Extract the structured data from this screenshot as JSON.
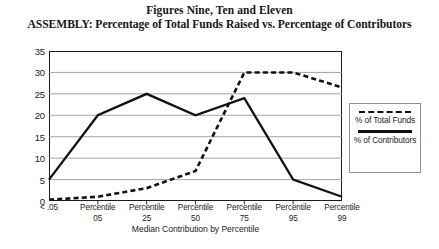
{
  "titles": {
    "main": "Figures Nine, Ten and Eleven",
    "sub": "ASSEMBLY: Percentage of Total Funds Raised vs. Percentage of Contributors"
  },
  "legend": {
    "entries": [
      {
        "key": "total-funds",
        "label": "% of Total Funds",
        "style": "dashed"
      },
      {
        "key": "contributors",
        "label": "% of Contributors",
        "style": "solid"
      }
    ]
  },
  "chart_data": {
    "type": "line",
    "title": "ASSEMBLY: Percentage of Total Funds Raised vs. Percentage of Contributors",
    "subtitle": "Figures Nine, Ten and Eleven",
    "xlabel": "Median Contribution by Percentile",
    "ylabel": "",
    "grid": true,
    "legend_position": "right",
    "ylim": [
      0,
      35
    ],
    "yticks": [
      0,
      5,
      10,
      15,
      20,
      25,
      30,
      35
    ],
    "categories": [
      "< .05",
      "Percentile 05",
      "Percentile 25",
      "Percentile 50",
      "Percentile 75",
      "Percentile 95",
      "Percentile 99"
    ],
    "category_lines": [
      {
        "l1": "< .05",
        "l2": ""
      },
      {
        "l1": "Percentile",
        "l2": "05"
      },
      {
        "l1": "Percentile",
        "l2": "25"
      },
      {
        "l1": "Percentile",
        "l2": "50"
      },
      {
        "l1": "Percentile",
        "l2": "75"
      },
      {
        "l1": "Percentile",
        "l2": "95"
      },
      {
        "l1": "Percentile",
        "l2": "99"
      }
    ],
    "series": [
      {
        "name": "% of Total Funds",
        "style": "dashed",
        "color": "#111115",
        "values": [
          0.3,
          1,
          3,
          7,
          30,
          30,
          26.5
        ]
      },
      {
        "name": "% of Contributors",
        "style": "solid",
        "color": "#111115",
        "values": [
          5,
          20,
          25,
          20,
          24,
          5,
          1
        ]
      }
    ]
  }
}
